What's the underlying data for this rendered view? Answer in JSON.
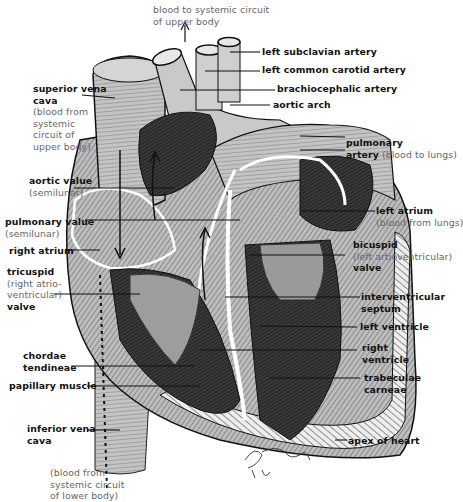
{
  "figure": {
    "signature": "Fuhsag '64",
    "colors": {
      "ink": "#111111",
      "note_text": "#666666",
      "tissue_light": "#c8c8c8",
      "tissue_mid": "#8a8a8a",
      "tissue_dark": "#2a2a2a",
      "background": "#ffffff"
    }
  },
  "labels": {
    "top_note": {
      "line1": "blood to systemic circuit",
      "line2": "of upper body",
      "arrow": "up-arrow"
    },
    "left_subclavian": {
      "bold": "left subclavian artery"
    },
    "left_common_carotid": {
      "bold": "left common carotid artery"
    },
    "brachiocephalic": {
      "bold": "brachiocephalic artery"
    },
    "aortic_arch": {
      "bold": "aortic arch"
    },
    "superior_vena_cava": {
      "bold1": "superior vena",
      "bold2": "cava",
      "note1": "(blood from",
      "note2": "systemic",
      "note3": "circuit of",
      "note4": "upper body)"
    },
    "pulmonary_artery": {
      "bold1": "pulmonary",
      "bold2": "artery",
      "note": "(blood to lungs)"
    },
    "aortic_valve": {
      "bold": "aortic value",
      "note": "(semilunar)"
    },
    "pulmonary_valve": {
      "bold": "pulmonary value",
      "note": "(semilunar)"
    },
    "right_atrium": {
      "bold": "right atrium"
    },
    "left_atrium": {
      "bold": "left atrium",
      "note": "(blood from lungs)"
    },
    "tricuspid": {
      "bold1": "tricuspid",
      "note1": "(right atrio-",
      "note2": "ventricular)",
      "bold2": "valve"
    },
    "bicuspid": {
      "bold1": "bicuspid",
      "note": "(left artioventricular)",
      "bold2": "valve"
    },
    "interventricular_septum": {
      "bold1": "interventricular",
      "bold2": "septum"
    },
    "left_ventricle": {
      "bold": "left ventricle"
    },
    "right_ventricle": {
      "bold1": "right",
      "bold2": "ventricle"
    },
    "chordae_tendineae": {
      "bold1": "chordae",
      "bold2": "tendineae"
    },
    "papillary_muscle": {
      "bold": "papillary muscle"
    },
    "trabeculae_carneae": {
      "bold1": "trabeculae",
      "bold2": "carneae"
    },
    "inferior_vena_cava": {
      "bold1": "inferior vena",
      "bold2": "cava"
    },
    "apex": {
      "bold": "apex of heart"
    },
    "bottom_note": {
      "line1": "(blood from",
      "line2": "systemic circuit",
      "line3": "of lower body)"
    }
  }
}
